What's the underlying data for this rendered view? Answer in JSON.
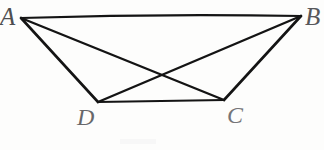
{
  "figure": {
    "kind": "geometry-diagram",
    "canvas": {
      "width": 324,
      "height": 150
    },
    "background_color": "#fdfdfc",
    "stroke_color": "#141414",
    "stroke_width": 2.2,
    "vertices": [
      {
        "id": "A",
        "label": "A",
        "x": 21,
        "y": 18,
        "label_x": 0,
        "label_y": 4
      },
      {
        "id": "B",
        "label": "B",
        "x": 301,
        "y": 16,
        "label_x": 305,
        "label_y": 4
      },
      {
        "id": "C",
        "label": "C",
        "x": 224,
        "y": 100,
        "label_x": 227,
        "label_y": 103
      },
      {
        "id": "D",
        "label": "D",
        "x": 98,
        "y": 102,
        "label_x": 77,
        "label_y": 105
      }
    ],
    "edges": [
      {
        "id": "AB",
        "from": "A",
        "to": "B",
        "role": "top-side"
      },
      {
        "id": "AD",
        "from": "A",
        "to": "D",
        "role": "left-side"
      },
      {
        "id": "DC",
        "from": "D",
        "to": "C",
        "role": "bottom-side"
      },
      {
        "id": "CB",
        "from": "C",
        "to": "B",
        "role": "right-side"
      },
      {
        "id": "AC",
        "from": "A",
        "to": "C",
        "role": "diagonal"
      },
      {
        "id": "BD",
        "from": "B",
        "to": "D",
        "role": "diagonal"
      }
    ],
    "intersection": {
      "id": "diagonal-crossing",
      "x": 160,
      "y": 75
    },
    "paths": {
      "AB": "M 21 18 Q 160 13.5 301 16",
      "AD": "M 21 18 L 98 102",
      "DC": "M 98 102 L 224 100",
      "CB": "M 224 100 L 301 16",
      "AC": "M 21 18 L 224 100",
      "BD": "M 301 16 L 98 102"
    }
  }
}
